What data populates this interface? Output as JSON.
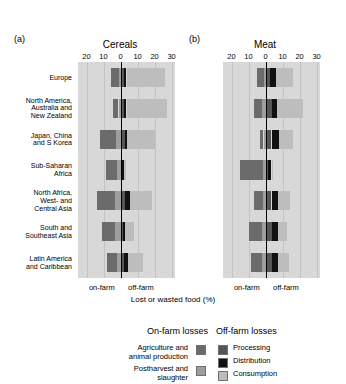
{
  "figure": {
    "xlabel": "Lost or wasted food (%)",
    "panels": [
      {
        "tag": "(a)",
        "title": "Cereals"
      },
      {
        "tag": "(b)",
        "title": "Meat"
      }
    ],
    "side_labels": {
      "left": "on-farm",
      "right": "off-farm"
    }
  },
  "legend": {
    "onfarm_heading": "On-farm losses",
    "offfarm_heading": "Off-farm losses",
    "onfarm_items": [
      {
        "label": "Agriculture and\nanimal production",
        "color": "#6b6b6b"
      },
      {
        "label": "Postharvest and\nslaughter",
        "color": "#9e9e9e"
      }
    ],
    "offfarm_items": [
      {
        "label": "Processing",
        "color": "#565656"
      },
      {
        "label": "Distribution",
        "color": "#111111"
      },
      {
        "label": "Consumption",
        "color": "#bdbdbd"
      }
    ]
  },
  "chart_data": {
    "type": "bar",
    "orientation": "horizontal",
    "layout": "diverging-stacked, two panels",
    "title": "",
    "xlabel": "Lost or wasted food (%)",
    "ylabel": "",
    "xlim": [
      -25,
      32
    ],
    "ticks": [
      -20,
      -10,
      0,
      10,
      20,
      30
    ],
    "tick_labels": [
      "20",
      "10",
      "0",
      "10",
      "20",
      "30"
    ],
    "grid": true,
    "legend_position": "bottom",
    "categories": [
      "Europe",
      "North America, Australia and New Zealand",
      "Japan, China and S Korea",
      "Sub-Saharan Africa",
      "North Africa, West- and Central Asia",
      "South and Southeast Asia",
      "Latin America and Caribbean"
    ],
    "series": [
      {
        "name": "Agriculture and animal production",
        "side": "on-farm",
        "color": "#6b6b6b",
        "cereals": [
          4.5,
          3.5,
          9.5,
          6.5,
          10.5,
          7.5,
          6.0
        ],
        "meat": [
          4.0,
          4.5,
          2.0,
          13.5,
          5.5,
          7.5,
          6.5
        ]
      },
      {
        "name": "Postharvest and slaughter",
        "side": "on-farm",
        "color": "#9e9e9e",
        "cereals": [
          1.2,
          1.2,
          2.8,
          2.2,
          3.5,
          3.2,
          2.2
        ],
        "meat": [
          1.0,
          2.2,
          1.2,
          1.5,
          1.5,
          2.0,
          2.2
        ]
      },
      {
        "name": "Processing",
        "side": "off-farm",
        "color": "#565656",
        "cereals": [
          2.0,
          2.0,
          2.5,
          1.0,
          2.5,
          1.5,
          2.0
        ],
        "meat": [
          2.5,
          4.0,
          3.5,
          1.5,
          3.5,
          4.0,
          4.0
        ]
      },
      {
        "name": "Distribution",
        "side": "off-farm",
        "color": "#111111",
        "cereals": [
          1.5,
          1.5,
          1.5,
          1.0,
          3.0,
          1.0,
          2.5
        ],
        "meat": [
          3.5,
          3.0,
          4.5,
          2.0,
          4.0,
          3.5,
          3.5
        ]
      },
      {
        "name": "Consumption",
        "side": "off-farm",
        "color": "#bdbdbd",
        "cereals": [
          22.5,
          24.0,
          16.0,
          1.5,
          13.0,
          5.5,
          8.5
        ],
        "meat": [
          10.0,
          15.0,
          8.0,
          1.0,
          7.0,
          5.0,
          6.5
        ]
      }
    ]
  }
}
